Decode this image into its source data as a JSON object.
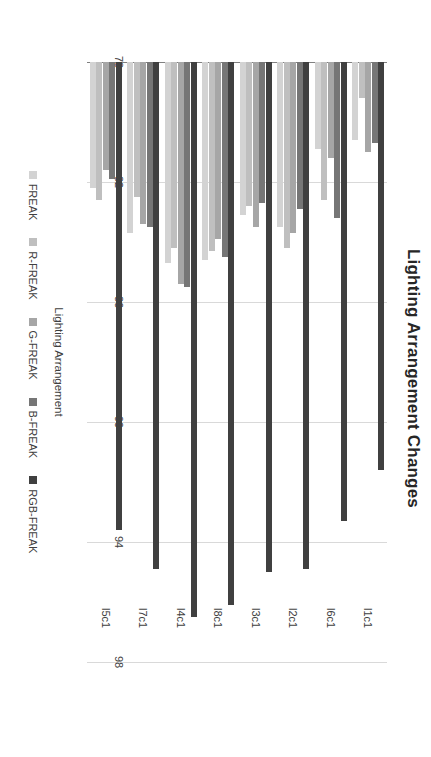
{
  "chart_data": {
    "type": "bar",
    "orientation": "horizontal",
    "title": "Lighting Arrangement Changes",
    "xlabel": "Lighting Arrangement",
    "ylabel": "Accuracy (%)",
    "categories": [
      "l1c1",
      "l6c1",
      "l2c1",
      "l3c1",
      "l8c1",
      "l4c1",
      "l7c1",
      "l5c1"
    ],
    "value_axis_ticks": [
      78,
      82,
      86,
      90,
      94,
      98
    ],
    "value_axis_range": [
      78,
      98
    ],
    "grid": true,
    "legend_position": "bottom",
    "series": [
      {
        "name": "FREAK",
        "color": "#d3d3d3",
        "values": [
          80.6,
          80.9,
          83.5,
          83.1,
          84.6,
          84.7,
          83.7,
          82.2
        ]
      },
      {
        "name": "R-FREAK",
        "color": "#bfbfbf",
        "values": [
          79.2,
          82.6,
          84.2,
          82.8,
          84.3,
          84.2,
          82.5,
          82.6
        ]
      },
      {
        "name": "G-FREAK",
        "color": "#a6a6a6",
        "values": [
          81.0,
          81.2,
          83.7,
          83.5,
          83.9,
          85.4,
          83.4,
          81.6
        ]
      },
      {
        "name": "B-FREAK",
        "color": "#767676",
        "values": [
          80.7,
          83.2,
          82.9,
          82.7,
          84.5,
          85.5,
          83.5,
          81.9
        ]
      },
      {
        "name": "RGB-FREAK",
        "color": "#404040",
        "values": [
          91.6,
          93.3,
          94.9,
          95.0,
          96.1,
          96.5,
          94.9,
          93.6
        ]
      }
    ]
  }
}
